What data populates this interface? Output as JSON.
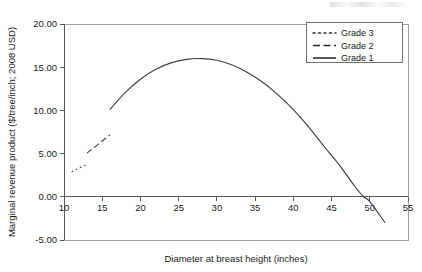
{
  "chart_data": {
    "type": "line",
    "title": "",
    "xlabel": "Diameter at breast height (inches)",
    "ylabel": "Marginal revenue product ($/tree/inch; 2008 USD)",
    "xlim": [
      10,
      55
    ],
    "ylim": [
      -5.0,
      20.0
    ],
    "xticks": [
      "10",
      "15",
      "20",
      "25",
      "30",
      "35",
      "40",
      "45",
      "50",
      "55"
    ],
    "xtick_values": [
      10,
      15,
      20,
      25,
      30,
      35,
      40,
      45,
      50,
      55
    ],
    "yticks": [
      "-5.00",
      "0.00",
      "5.00",
      "10.00",
      "15.00",
      "20.00"
    ],
    "ytick_values": [
      -5.0,
      0.0,
      5.0,
      10.0,
      15.0,
      20.0
    ],
    "grid": false,
    "legend_position": "top-right",
    "series": [
      {
        "name": "Grade 3",
        "style": "dotted",
        "x": [
          11.0,
          11.5,
          12.0,
          12.5,
          13.0
        ],
        "values": [
          2.9,
          3.1,
          3.35,
          3.55,
          3.7
        ]
      },
      {
        "name": "Grade 2",
        "style": "dashed",
        "x": [
          13.0,
          13.5,
          14.0,
          14.5,
          15.0,
          15.5,
          16.0
        ],
        "values": [
          5.05,
          5.4,
          5.75,
          6.1,
          6.45,
          6.8,
          7.15
        ]
      },
      {
        "name": "Grade 1",
        "style": "solid",
        "x": [
          16.0,
          18.0,
          20.0,
          22.0,
          24.0,
          26.0,
          28.0,
          30.0,
          32.0,
          34.0,
          36.0,
          38.0,
          40.0,
          42.0,
          44.0,
          46.0,
          48.0,
          49.2,
          50.0,
          52.0
        ],
        "values": [
          10.1,
          12.05,
          13.6,
          14.75,
          15.5,
          15.9,
          16.0,
          15.8,
          15.25,
          14.4,
          13.25,
          11.8,
          10.1,
          8.1,
          5.85,
          3.7,
          1.25,
          0.0,
          -0.55,
          -3.0
        ]
      }
    ],
    "annotations": []
  },
  "legend": {
    "entries": [
      {
        "label": "Grade 3",
        "style": "dotted"
      },
      {
        "label": "Grade 2",
        "style": "dashed"
      },
      {
        "label": "Grade 1",
        "style": "solid"
      }
    ]
  }
}
